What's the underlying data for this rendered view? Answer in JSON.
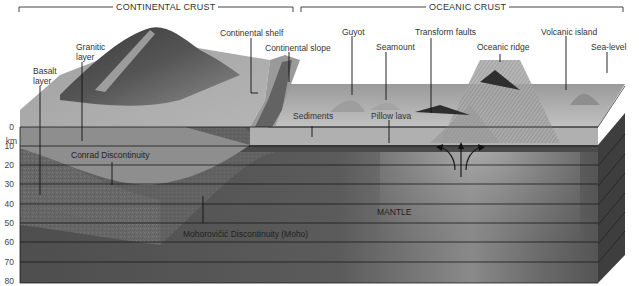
{
  "diagram": {
    "sections": {
      "continental": "CONTINENTAL CRUST",
      "oceanic": "OCEANIC CRUST"
    },
    "axis": {
      "unit": "km",
      "ticks": [
        "0",
        "10",
        "20",
        "30",
        "40",
        "50",
        "60",
        "70",
        "80"
      ]
    },
    "surface_labels": {
      "basalt_layer": "Basalt\nlayer",
      "basalt_line1": "Basalt",
      "basalt_line2": "layer",
      "granitic_line1": "Granitic",
      "granitic_line2": "layer",
      "continental_shelf": "Continental shelf",
      "continental_slope": "Continental slope",
      "guyot": "Guyot",
      "seamount": "Seamount",
      "transform_faults": "Transform faults",
      "oceanic_ridge": "Oceanic ridge",
      "volcanic_island": "Volcanic island",
      "sea_level": "Sea-level"
    },
    "subsurface_labels": {
      "sediments": "Sediments",
      "pillow_lava": "Pillow lava",
      "conrad": "Conrad Discontinuity",
      "moho": "Mohorovičić Discontinuity (Moho)",
      "mantle": "MANTLE"
    },
    "colors": {
      "mantle": "#5a5a5a",
      "basalt": "#6e6e6e",
      "granite": "#8c8c8c",
      "land": "#a8a8a8",
      "ocean_surface": "#b4b4b4",
      "grid_line": "#1a1a1a"
    }
  }
}
